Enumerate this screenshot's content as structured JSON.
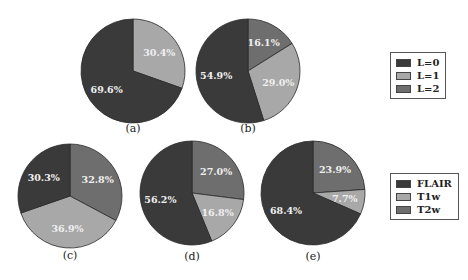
{
  "chart_data": [
    {
      "type": "pie",
      "id": "a",
      "caption": "(a)",
      "legend_group": "level",
      "slices": [
        {
          "label": "L=0",
          "value": 69.6,
          "text": "69.6%"
        },
        {
          "label": "L=1",
          "value": 30.4,
          "text": "30.4%"
        }
      ]
    },
    {
      "type": "pie",
      "id": "b",
      "caption": "(b)",
      "legend_group": "level",
      "slices": [
        {
          "label": "L=0",
          "value": 54.9,
          "text": "54.9%"
        },
        {
          "label": "L=1",
          "value": 29.0,
          "text": "29.0%"
        },
        {
          "label": "L=2",
          "value": 16.1,
          "text": "16.1%"
        }
      ]
    },
    {
      "type": "pie",
      "id": "c",
      "caption": "(c)",
      "legend_group": "modality",
      "slices": [
        {
          "label": "FLAIR",
          "value": 30.3,
          "text": "30.3%"
        },
        {
          "label": "T1w",
          "value": 36.9,
          "text": "36.9%"
        },
        {
          "label": "T2w",
          "value": 32.8,
          "text": "32.8%"
        }
      ]
    },
    {
      "type": "pie",
      "id": "d",
      "caption": "(d)",
      "legend_group": "modality",
      "slices": [
        {
          "label": "FLAIR",
          "value": 56.2,
          "text": "56.2%"
        },
        {
          "label": "T1w",
          "value": 16.8,
          "text": "16.8%"
        },
        {
          "label": "T2w",
          "value": 27.0,
          "text": "27.0%"
        }
      ]
    },
    {
      "type": "pie",
      "id": "e",
      "caption": "(e)",
      "legend_group": "modality",
      "slices": [
        {
          "label": "FLAIR",
          "value": 68.4,
          "text": "68.4%"
        },
        {
          "label": "T1w",
          "value": 7.7,
          "text": "7.7%"
        },
        {
          "label": "T2w",
          "value": 23.9,
          "text": "23.9%"
        }
      ]
    }
  ],
  "legends": {
    "level": {
      "entries": [
        {
          "label": "L=0",
          "color": "#3a3a3a"
        },
        {
          "label": "L=1",
          "color": "#a8a8a8"
        },
        {
          "label": "L=2",
          "color": "#6e6e6e"
        }
      ]
    },
    "modality": {
      "entries": [
        {
          "label": "FLAIR",
          "color": "#3a3a3a"
        },
        {
          "label": "T1w",
          "color": "#a8a8a8"
        },
        {
          "label": "T2w",
          "color": "#6e6e6e"
        }
      ]
    }
  },
  "colors": {
    "dark": "#3a3a3a",
    "light": "#a8a8a8",
    "mid": "#6e6e6e",
    "label_text": "#f0f0f0",
    "outline": "#2a2a2a"
  }
}
